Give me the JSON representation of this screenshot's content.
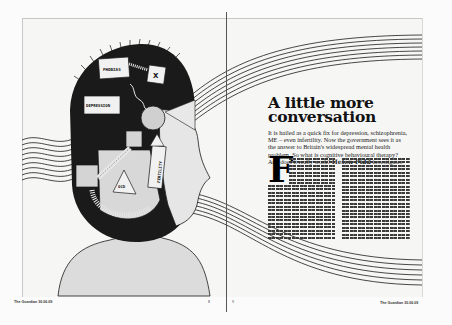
{
  "article": {
    "headline_line1": "A little more",
    "headline_line2": "conversation",
    "standfirst": "It is hailed as a quick fix for depression, schizophrenia, ME – even infertility. Now the government sees it as the answer to Britain's widespread mental health problem. So what is cognitive behavioural therapy? And does it really work?",
    "byline_name": "Helen Pidd",
    "byline_suffix": "investigates",
    "drop_cap": "F"
  },
  "illustration": {
    "labels": [
      "PHOBIAS",
      "X",
      "DEPRESSION",
      "OCD",
      "FERTILITY"
    ],
    "colors": {
      "ink": "#1a1a1a",
      "head_fill": "#d8d8d8",
      "face_fill": "#e6e6e6",
      "stripe_fill": "#bdbdbd",
      "paper": "#f6f6f5"
    }
  },
  "footer": {
    "left": "The Guardian 30.06.09",
    "right": "The Guardian 30.06.09",
    "left_page_marker": "8",
    "right_page_marker": "9"
  }
}
